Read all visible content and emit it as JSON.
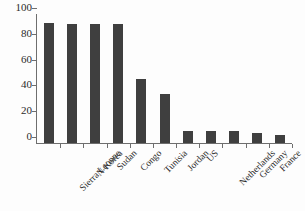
{
  "chart_data": {
    "type": "bar",
    "title": "",
    "subtitle": "",
    "xlabel": "",
    "ylabel": "",
    "ylim": [
      0,
      100
    ],
    "yticks": [
      0,
      20,
      40,
      60,
      80,
      100
    ],
    "grid": false,
    "legend": false,
    "legend_position": "none",
    "bar_color": "#3f3f3f",
    "axis_color": "#6e6e6e",
    "categories": [
      "Sierra Leonne",
      "N Korea",
      "Sudan",
      "Congo",
      "Tunisia",
      "Jordan",
      "US",
      "Netherlands",
      "Germany",
      "France",
      "Switzerland"
    ],
    "values": [
      93,
      92,
      92,
      92,
      50,
      38,
      9,
      9,
      9,
      8,
      6
    ]
  }
}
